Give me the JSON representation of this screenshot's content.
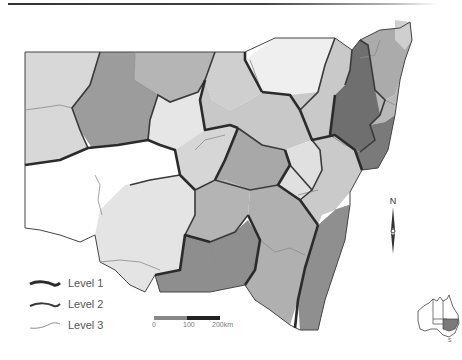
{
  "map": {
    "title": "",
    "region": "New South Wales",
    "regions_count": 34,
    "colors": {
      "level1_line": "#2b2b2b",
      "level2_line": "#3a3a3a",
      "level3_line": "#8a8a8a",
      "fill_white": "#ffffff",
      "fill_lightest": "#ececec",
      "fill_light": "#d6d6d6",
      "fill_mid": "#bdbdbd",
      "fill_dark": "#a3a3a3",
      "fill_darker": "#8a8a8a",
      "fill_darkest": "#6f6f6f"
    }
  },
  "legend": {
    "items": [
      {
        "label": "Level 1",
        "weight": "thick"
      },
      {
        "label": "Level 2",
        "weight": "medium"
      },
      {
        "label": "Level 3",
        "weight": "thin"
      }
    ]
  },
  "scale_bar": {
    "labels": [
      "0",
      "100",
      "200km"
    ]
  },
  "north_arrow": {
    "label": "N"
  },
  "inset": {
    "name": "Australia locator map",
    "highlight": "NSW",
    "label": "S"
  }
}
